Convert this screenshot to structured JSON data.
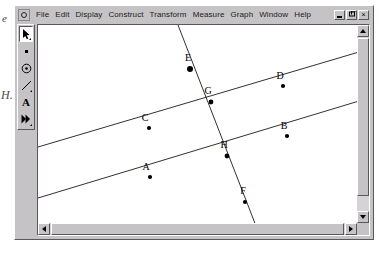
{
  "page_margin": {
    "top_fragment": "e",
    "bottom_fragment": "H."
  },
  "window": {
    "app_icon": "sketchpad-icon",
    "caption_buttons": [
      {
        "name": "minimize",
        "glyph": "_"
      },
      {
        "name": "restore",
        "glyph": "❐"
      },
      {
        "name": "close",
        "glyph": "×"
      }
    ]
  },
  "menu": {
    "items": [
      {
        "label": "File"
      },
      {
        "label": "Edit"
      },
      {
        "label": "Display"
      },
      {
        "label": "Construct"
      },
      {
        "label": "Transform"
      },
      {
        "label": "Measure"
      },
      {
        "label": "Graph"
      },
      {
        "label": "Window"
      },
      {
        "label": "Help"
      }
    ]
  },
  "toolbar": {
    "tools": [
      {
        "name": "selection-arrow-tool",
        "icon": "arrow-icon",
        "selected": true
      },
      {
        "name": "point-tool",
        "icon": "point-icon",
        "selected": false
      },
      {
        "name": "compass-circle-tool",
        "icon": "circle-icon",
        "selected": false
      },
      {
        "name": "straightedge-tool",
        "icon": "line-icon",
        "selected": false
      },
      {
        "name": "text-tool",
        "icon": "text-a-icon",
        "label": "A",
        "selected": false
      },
      {
        "name": "custom-tool",
        "icon": "double-arrow-icon",
        "selected": false
      }
    ]
  },
  "sketch": {
    "stroke_color": "#1a1a1a",
    "point_color": "#000000",
    "background": "#ffffff",
    "points": [
      {
        "label": "A",
        "x": 112,
        "y": 152,
        "label_dx": -4,
        "label_dy": -7,
        "size": 2.1
      },
      {
        "label": "B",
        "x": 249,
        "y": 111,
        "label_dx": -3,
        "label_dy": -7,
        "size": 2.1
      },
      {
        "label": "C",
        "x": 111,
        "y": 103,
        "label_dx": -4,
        "label_dy": -7,
        "size": 2.1
      },
      {
        "label": "D",
        "x": 245,
        "y": 61,
        "label_dx": -3,
        "label_dy": -7,
        "size": 2.1
      },
      {
        "label": "E",
        "x": 152,
        "y": 44,
        "label_dx": -2,
        "label_dy": -8,
        "size": 3.0
      },
      {
        "label": "F",
        "x": 207,
        "y": 177,
        "label_dx": -2,
        "label_dy": -8,
        "size": 2.1
      },
      {
        "label": "G",
        "x": 173,
        "y": 77,
        "label_dx": -3,
        "label_dy": -8,
        "size": 2.4
      },
      {
        "label": "H",
        "x": 189,
        "y": 131,
        "label_dx": -3,
        "label_dy": -8,
        "size": 2.4
      }
    ],
    "lines": [
      {
        "name": "upper-parallel-line",
        "x1": 0,
        "y1": 122,
        "x2": 321,
        "y2": 27
      },
      {
        "name": "lower-parallel-line",
        "x1": 0,
        "y1": 173,
        "x2": 321,
        "y2": 76
      },
      {
        "name": "transversal-line",
        "x1": 140,
        "y1": 0,
        "x2": 232,
        "y2": 237
      }
    ]
  },
  "scrollbars": {
    "vertical": {
      "name": "vertical-scrollbar",
      "up": "scroll-up-arrow",
      "down": "scroll-down-arrow"
    },
    "horizontal": {
      "name": "horizontal-scrollbar",
      "left": "scroll-left-arrow",
      "right": "scroll-right-arrow"
    }
  }
}
